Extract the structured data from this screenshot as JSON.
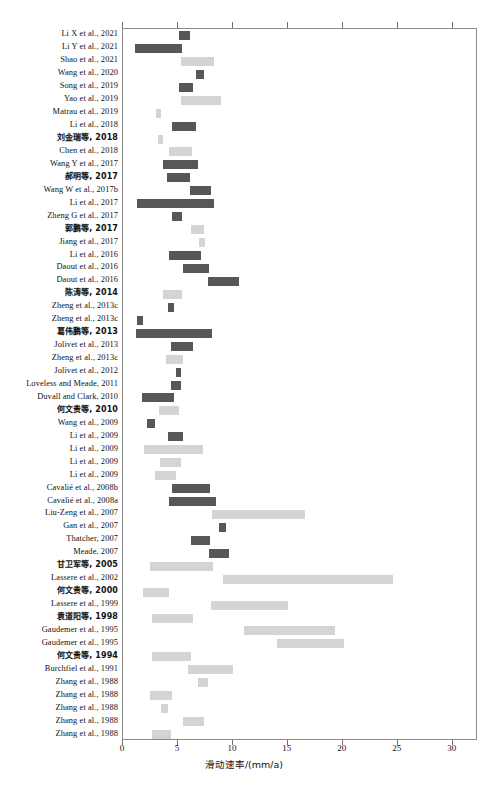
{
  "chart_data": {
    "type": "bar",
    "orientation": "horizontal-range",
    "title": "",
    "xlabel": "滑动速率/(mm/a)",
    "ylabel": "",
    "xlim": [
      0,
      32.3
    ],
    "xticks": [
      0,
      5,
      10,
      15,
      20,
      25,
      30
    ],
    "xtick_labels": [
      "0",
      "5",
      "10",
      "15",
      "20",
      "25",
      "30"
    ],
    "grid": false,
    "legend": {
      "position": "top-right",
      "entries": [
        {
          "label": "第四纪滑动速率",
          "color": "#d4d4d4",
          "key": "quaternary"
        },
        {
          "label": "大地测量滑动速率",
          "color": "#575757",
          "key": "geodetic"
        }
      ]
    },
    "categories": [
      "Li X et al., 2021",
      "Li Y et al., 2021",
      "Shao et al., 2021",
      "Wang et al., 2020",
      "Song et al., 2019",
      "Yao et al., 2019",
      "Matrau et al., 2019",
      "Li et al., 2018",
      "刘金瑞等, 2018",
      "Chen et al., 2018",
      "Wang Y et al., 2017",
      "郝明等, 2017",
      "Wang W et al., 2017b",
      "Li et al., 2017",
      "Zheng G et al., 2017",
      "郭鹏等, 2017",
      "Jiang et al., 2017",
      "Li et al., 2016",
      "Daout et al., 2016",
      "Daout et al., 2016",
      "陈涛等, 2014",
      "Zheng et al., 2013c",
      "Zheng et al., 2013c",
      "葛伟鹏等, 2013",
      "Jolivet et al., 2013",
      "Zheng et al., 2013c",
      "Jolivet et al., 2012",
      "Loveless and Meade, 2011",
      "Duvall and Clark, 2010",
      "何文贵等, 2010",
      "Wang et al., 2009",
      "Li et al., 2009",
      "Li et al., 2009",
      "Li et al., 2009",
      "Li et al., 2009",
      "Cavalié et al., 2008b",
      "Cavalié et al., 2008a",
      "Liu-Zeng et al., 2007",
      "Gan et al., 2007",
      "Thatcher, 2007",
      "Meade, 2007",
      "甘卫军等, 2005",
      "Lassere et al., 2002",
      "何文贵等, 2000",
      "Lassere et al., 1999",
      "袁道阳等, 1998",
      "Gaudemer et al., 1995",
      "Gaudemer et al., 1995",
      "何文贵等, 1994",
      "Burchfiel et al., 1991",
      "Zhang et al., 1988",
      "Zhang et al., 1988",
      "Zhang et al., 1988",
      "Zhang et al., 1988",
      "Zhang et al., 1988"
    ],
    "bars": [
      {
        "row": 0,
        "series": "geodetic",
        "start": 5.1,
        "end": 6.1
      },
      {
        "row": 1,
        "series": "geodetic",
        "start": 1.1,
        "end": 5.4
      },
      {
        "row": 2,
        "series": "quaternary",
        "start": 5.3,
        "end": 8.3
      },
      {
        "row": 3,
        "series": "geodetic",
        "start": 6.6,
        "end": 7.4
      },
      {
        "row": 4,
        "series": "geodetic",
        "start": 5.1,
        "end": 6.4
      },
      {
        "row": 5,
        "series": "quaternary",
        "start": 5.3,
        "end": 8.9
      },
      {
        "row": 6,
        "series": "quaternary",
        "start": 3.0,
        "end": 3.5
      },
      {
        "row": 7,
        "series": "geodetic",
        "start": 4.5,
        "end": 6.6
      },
      {
        "row": 8,
        "series": "quaternary",
        "start": 3.2,
        "end": 3.6
      },
      {
        "row": 9,
        "series": "quaternary",
        "start": 4.2,
        "end": 6.3
      },
      {
        "row": 10,
        "series": "geodetic",
        "start": 3.6,
        "end": 6.8
      },
      {
        "row": 11,
        "series": "geodetic",
        "start": 4.0,
        "end": 6.1
      },
      {
        "row": 12,
        "series": "geodetic",
        "start": 6.1,
        "end": 8.0
      },
      {
        "row": 13,
        "series": "geodetic",
        "start": 1.3,
        "end": 8.3
      },
      {
        "row": 14,
        "series": "geodetic",
        "start": 4.5,
        "end": 5.4
      },
      {
        "row": 15,
        "series": "quaternary",
        "start": 6.2,
        "end": 7.4
      },
      {
        "row": 16,
        "series": "quaternary",
        "start": 6.9,
        "end": 7.5
      },
      {
        "row": 17,
        "series": "geodetic",
        "start": 4.2,
        "end": 7.1
      },
      {
        "row": 18,
        "series": "geodetic",
        "start": 5.5,
        "end": 7.8
      },
      {
        "row": 19,
        "series": "geodetic",
        "start": 7.7,
        "end": 10.6
      },
      {
        "row": 20,
        "series": "quaternary",
        "start": 3.6,
        "end": 5.4
      },
      {
        "row": 21,
        "series": "geodetic",
        "start": 4.1,
        "end": 4.6
      },
      {
        "row": 22,
        "series": "geodetic",
        "start": 1.3,
        "end": 1.8
      },
      {
        "row": 23,
        "series": "geodetic",
        "start": 1.2,
        "end": 8.1
      },
      {
        "row": 24,
        "series": "geodetic",
        "start": 4.4,
        "end": 6.4
      },
      {
        "row": 25,
        "series": "quaternary",
        "start": 3.9,
        "end": 5.5
      },
      {
        "row": 26,
        "series": "geodetic",
        "start": 4.8,
        "end": 5.3
      },
      {
        "row": 27,
        "series": "geodetic",
        "start": 4.4,
        "end": 5.3
      },
      {
        "row": 28,
        "series": "geodetic",
        "start": 1.7,
        "end": 4.6
      },
      {
        "row": 29,
        "series": "quaternary",
        "start": 3.3,
        "end": 5.1
      },
      {
        "row": 30,
        "series": "geodetic",
        "start": 2.2,
        "end": 2.9
      },
      {
        "row": 31,
        "series": "geodetic",
        "start": 4.1,
        "end": 5.5
      },
      {
        "row": 32,
        "series": "quaternary",
        "start": 1.9,
        "end": 7.3
      },
      {
        "row": 33,
        "series": "quaternary",
        "start": 3.4,
        "end": 5.3
      },
      {
        "row": 34,
        "series": "quaternary",
        "start": 2.9,
        "end": 4.8
      },
      {
        "row": 35,
        "series": "geodetic",
        "start": 4.5,
        "end": 7.9
      },
      {
        "row": 36,
        "series": "geodetic",
        "start": 4.2,
        "end": 8.5
      },
      {
        "row": 37,
        "series": "quaternary",
        "start": 8.1,
        "end": 16.6
      },
      {
        "row": 38,
        "series": "geodetic",
        "start": 8.7,
        "end": 9.4
      },
      {
        "row": 39,
        "series": "geodetic",
        "start": 6.2,
        "end": 7.9
      },
      {
        "row": 40,
        "series": "geodetic",
        "start": 7.8,
        "end": 9.6
      },
      {
        "row": 41,
        "series": "quaternary",
        "start": 2.5,
        "end": 8.2
      },
      {
        "row": 42,
        "series": "quaternary",
        "start": 9.1,
        "end": 24.6
      },
      {
        "row": 43,
        "series": "quaternary",
        "start": 1.8,
        "end": 4.2
      },
      {
        "row": 44,
        "series": "quaternary",
        "start": 8.0,
        "end": 15.0
      },
      {
        "row": 45,
        "series": "quaternary",
        "start": 2.6,
        "end": 6.4
      },
      {
        "row": 46,
        "series": "quaternary",
        "start": 11.0,
        "end": 19.3
      },
      {
        "row": 47,
        "series": "quaternary",
        "start": 14.0,
        "end": 20.1
      },
      {
        "row": 48,
        "series": "quaternary",
        "start": 2.6,
        "end": 6.2
      },
      {
        "row": 49,
        "series": "quaternary",
        "start": 5.9,
        "end": 10.0
      },
      {
        "row": 50,
        "series": "quaternary",
        "start": 6.8,
        "end": 7.7
      },
      {
        "row": 51,
        "series": "quaternary",
        "start": 2.5,
        "end": 4.5
      },
      {
        "row": 52,
        "series": "quaternary",
        "start": 3.5,
        "end": 4.1
      },
      {
        "row": 53,
        "series": "quaternary",
        "start": 5.5,
        "end": 7.4
      },
      {
        "row": 54,
        "series": "quaternary",
        "start": 2.6,
        "end": 4.4
      }
    ]
  }
}
